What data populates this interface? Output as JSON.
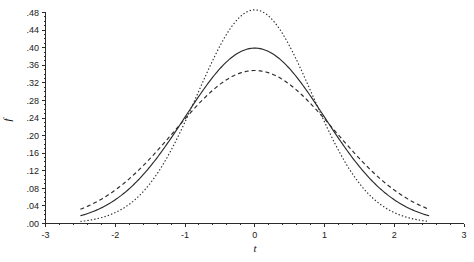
{
  "chart_data": {
    "type": "line",
    "title": "",
    "subtitle": "",
    "xlabel": "t",
    "ylabel": "f",
    "xlim": [
      -3,
      3
    ],
    "ylim": [
      0.0,
      0.5
    ],
    "grid": false,
    "legend": "none",
    "x_ticks": [
      -3,
      -2,
      -1,
      0,
      1,
      2,
      3
    ],
    "x_tick_labels": [
      "-3",
      "-2",
      "-1",
      "0",
      "1",
      "2",
      "3"
    ],
    "y_ticks": [
      0.0,
      0.04,
      0.08,
      0.12,
      0.16,
      0.2,
      0.24,
      0.28,
      0.32,
      0.36,
      0.4,
      0.44,
      0.48
    ],
    "y_tick_labels": [
      ".00",
      ".04",
      ".08",
      ".12",
      ".16",
      ".20",
      ".24",
      ".28",
      ".32",
      ".36",
      ".40",
      ".44",
      ".48"
    ],
    "x_minor_tick_step": 0.2,
    "y_minor_tick_step": 0.01,
    "x_domain_drawn": [
      -2.5,
      2.5
    ],
    "series": [
      {
        "name": "narrow-density",
        "style": "dotted",
        "peak_x": 0.0,
        "peak_y": 0.486,
        "sigma": 0.82,
        "x": [
          -2.5,
          -2.4,
          -2.3,
          -2.2,
          -2.1,
          -2.0,
          -1.9,
          -1.8,
          -1.7,
          -1.6,
          -1.5,
          -1.4,
          -1.3,
          -1.2,
          -1.1,
          -1.0,
          -0.9,
          -0.8,
          -0.7,
          -0.6,
          -0.5,
          -0.4,
          -0.3,
          -0.2,
          -0.1,
          0.0,
          0.1,
          0.2,
          0.3,
          0.4,
          0.5,
          0.6,
          0.7,
          0.8,
          0.9,
          1.0,
          1.1,
          1.2,
          1.3,
          1.4,
          1.5,
          1.6,
          1.7,
          1.8,
          1.9,
          2.0,
          2.1,
          2.2,
          2.3,
          2.4,
          2.5
        ],
        "y": [
          0.004,
          0.006,
          0.009,
          0.013,
          0.018,
          0.026,
          0.035,
          0.047,
          0.062,
          0.081,
          0.103,
          0.129,
          0.159,
          0.192,
          0.228,
          0.265,
          0.303,
          0.339,
          0.374,
          0.405,
          0.431,
          0.452,
          0.469,
          0.48,
          0.485,
          0.486,
          0.485,
          0.48,
          0.469,
          0.452,
          0.431,
          0.405,
          0.374,
          0.339,
          0.303,
          0.265,
          0.228,
          0.192,
          0.159,
          0.129,
          0.103,
          0.081,
          0.062,
          0.047,
          0.035,
          0.026,
          0.018,
          0.013,
          0.009,
          0.006,
          0.004
        ]
      },
      {
        "name": "standard-normal-density",
        "style": "solid",
        "peak_x": 0.0,
        "peak_y": 0.399,
        "sigma": 1.0,
        "x": [
          -2.5,
          -2.4,
          -2.3,
          -2.2,
          -2.1,
          -2.0,
          -1.9,
          -1.8,
          -1.7,
          -1.6,
          -1.5,
          -1.4,
          -1.3,
          -1.2,
          -1.1,
          -1.0,
          -0.9,
          -0.8,
          -0.7,
          -0.6,
          -0.5,
          -0.4,
          -0.3,
          -0.2,
          -0.1,
          0.0,
          0.1,
          0.2,
          0.3,
          0.4,
          0.5,
          0.6,
          0.7,
          0.8,
          0.9,
          1.0,
          1.1,
          1.2,
          1.3,
          1.4,
          1.5,
          1.6,
          1.7,
          1.8,
          1.9,
          2.0,
          2.1,
          2.2,
          2.3,
          2.4,
          2.5
        ],
        "y": [
          0.018,
          0.022,
          0.028,
          0.035,
          0.044,
          0.054,
          0.066,
          0.079,
          0.094,
          0.111,
          0.13,
          0.15,
          0.171,
          0.194,
          0.218,
          0.242,
          0.266,
          0.29,
          0.312,
          0.333,
          0.352,
          0.368,
          0.381,
          0.391,
          0.397,
          0.399,
          0.397,
          0.391,
          0.381,
          0.368,
          0.352,
          0.333,
          0.312,
          0.29,
          0.266,
          0.242,
          0.218,
          0.194,
          0.171,
          0.15,
          0.13,
          0.111,
          0.094,
          0.079,
          0.066,
          0.054,
          0.044,
          0.035,
          0.028,
          0.022,
          0.018
        ]
      },
      {
        "name": "wide-density",
        "style": "dashed",
        "peak_x": 0.0,
        "peak_y": 0.348,
        "sigma": 1.147,
        "x": [
          -2.5,
          -2.4,
          -2.3,
          -2.2,
          -2.1,
          -2.0,
          -1.9,
          -1.8,
          -1.7,
          -1.6,
          -1.5,
          -1.4,
          -1.3,
          -1.2,
          -1.1,
          -1.0,
          -0.9,
          -0.8,
          -0.7,
          -0.6,
          -0.5,
          -0.4,
          -0.3,
          -0.2,
          -0.1,
          0.0,
          0.1,
          0.2,
          0.3,
          0.4,
          0.5,
          0.6,
          0.7,
          0.8,
          0.9,
          1.0,
          1.1,
          1.2,
          1.3,
          1.4,
          1.5,
          1.6,
          1.7,
          1.8,
          1.9,
          2.0,
          2.1,
          2.2,
          2.3,
          2.4,
          2.5
        ],
        "y": [
          0.032,
          0.038,
          0.045,
          0.053,
          0.062,
          0.072,
          0.083,
          0.095,
          0.108,
          0.122,
          0.137,
          0.153,
          0.169,
          0.186,
          0.203,
          0.22,
          0.237,
          0.253,
          0.268,
          0.283,
          0.296,
          0.308,
          0.318,
          0.326,
          0.332,
          0.348,
          0.332,
          0.326,
          0.318,
          0.308,
          0.296,
          0.283,
          0.268,
          0.253,
          0.237,
          0.22,
          0.203,
          0.186,
          0.169,
          0.153,
          0.137,
          0.122,
          0.108,
          0.095,
          0.083,
          0.072,
          0.062,
          0.053,
          0.045,
          0.038,
          0.032
        ]
      }
    ],
    "annotations": []
  }
}
